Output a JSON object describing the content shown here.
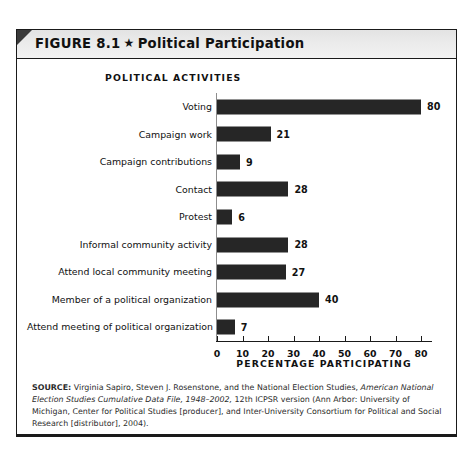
{
  "figure": {
    "label": "FIGURE 8.1",
    "star_glyph": "★",
    "title": "Political Participation",
    "category_axis_caption": "POLITICAL ACTIVITIES"
  },
  "source": {
    "prefix": "SOURCE:",
    "part1": " Virginia Sapiro, Steven J. Rosenstone, and the National Election Studies, ",
    "italic1": "American National Election Studies Cumulative Data File, 1948–2002,",
    "part2": " 12th ICPSR version (Ann Arbor: University of Michigan, Center for Political Studies [producer], and Inter-University Consortium for Political and Social Research [distributor], 2004)."
  },
  "colors": {
    "bar": "#262626",
    "header_band": "#e8e8e8",
    "frame_border": "#1a1a1a",
    "text": "#111111"
  },
  "chart_data": {
    "type": "bar",
    "orientation": "horizontal",
    "title": "Political Participation",
    "xlabel": "PERCENTAGE PARTICIPATING",
    "ylabel": "POLITICAL ACTIVITIES",
    "xlim": [
      0,
      85
    ],
    "xticks": [
      0,
      10,
      20,
      30,
      40,
      50,
      60,
      70,
      80
    ],
    "grid": false,
    "legend": false,
    "categories": [
      "Voting",
      "Campaign work",
      "Campaign contributions",
      "Contact",
      "Protest",
      "Informal community activity",
      "Attend local community meeting",
      "Member of a political organization",
      "Attend meeting of political organization"
    ],
    "values": [
      80,
      21,
      9,
      28,
      6,
      28,
      27,
      40,
      7
    ],
    "value_labels": [
      "80",
      "21",
      "9",
      "28",
      "6",
      "28",
      "27",
      "40",
      "7"
    ]
  }
}
